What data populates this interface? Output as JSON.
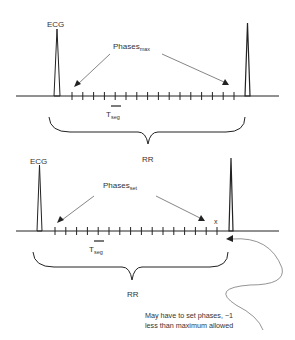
{
  "diagram": {
    "top_panel": {
      "ecg_label": "ECG",
      "phases_label": "Phases",
      "phases_subscript": "max",
      "tseg_label": "T",
      "tseg_subscript": "seg",
      "rr_label": "RR",
      "tick_count": 16
    },
    "bottom_panel": {
      "ecg_label": "ECG",
      "phases_label": "Phases",
      "phases_subscript": "set",
      "tseg_label": "T",
      "tseg_subscript": "seg",
      "rr_label": "RR",
      "x_marker": "x",
      "tick_count": 16,
      "annotation_line1": "May have to set phases, ~1",
      "annotation_line2": "less than maximum allowed"
    },
    "colors": {
      "line": "#222222",
      "arrow": "#555555",
      "text": "#333333"
    }
  }
}
